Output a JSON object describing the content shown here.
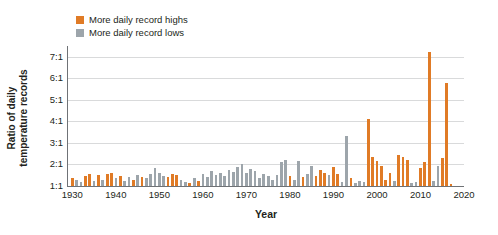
{
  "chart_data": {
    "type": "bar",
    "title": "",
    "subtitle": "",
    "xlabel": "Year",
    "ylabel": "Ratio of daily temperature records",
    "xlim": [
      1929,
      2020
    ],
    "ylim": [
      1,
      7.5
    ],
    "grid": true,
    "legend_position": "top-left",
    "ytick_labels": [
      "1:1",
      "2:1",
      "3:1",
      "4:1",
      "5:1",
      "6:1",
      "7:1"
    ],
    "ytick_values": [
      1,
      2,
      3,
      4,
      5,
      6,
      7
    ],
    "xtick_labels": [
      "1930",
      "1940",
      "1950",
      "1960",
      "1970",
      "1980",
      "1990",
      "2000",
      "2010",
      "2020"
    ],
    "xtick_values": [
      1930,
      1940,
      1950,
      1960,
      1970,
      1980,
      1990,
      2000,
      2010,
      2020
    ],
    "colors": {
      "highs": "#E07B26",
      "lows": "#9DA5AB",
      "gridline": "#D9DADB",
      "axis": "#6F7276",
      "text": "#231F20",
      "background": "#FFFFFF"
    },
    "series": [
      {
        "name": "More daily record highs",
        "color": "#E07B26"
      },
      {
        "name": "More daily record lows",
        "color": "#9DA5AB"
      }
    ],
    "bars": [
      {
        "year": 1930,
        "value": 1.35,
        "series": "highs"
      },
      {
        "year": 1931,
        "value": 1.3,
        "series": "lows"
      },
      {
        "year": 1932,
        "value": 1.2,
        "series": "lows"
      },
      {
        "year": 1933,
        "value": 1.45,
        "series": "highs"
      },
      {
        "year": 1934,
        "value": 1.55,
        "series": "highs"
      },
      {
        "year": 1935,
        "value": 1.25,
        "series": "lows"
      },
      {
        "year": 1936,
        "value": 1.5,
        "series": "highs"
      },
      {
        "year": 1937,
        "value": 1.3,
        "series": "lows"
      },
      {
        "year": 1938,
        "value": 1.55,
        "series": "highs"
      },
      {
        "year": 1939,
        "value": 1.6,
        "series": "highs"
      },
      {
        "year": 1940,
        "value": 1.35,
        "series": "lows"
      },
      {
        "year": 1941,
        "value": 1.45,
        "series": "highs"
      },
      {
        "year": 1942,
        "value": 1.25,
        "series": "lows"
      },
      {
        "year": 1943,
        "value": 1.4,
        "series": "lows"
      },
      {
        "year": 1944,
        "value": 1.3,
        "series": "highs"
      },
      {
        "year": 1945,
        "value": 1.5,
        "series": "lows"
      },
      {
        "year": 1946,
        "value": 1.4,
        "series": "highs"
      },
      {
        "year": 1947,
        "value": 1.35,
        "series": "lows"
      },
      {
        "year": 1948,
        "value": 1.55,
        "series": "lows"
      },
      {
        "year": 1949,
        "value": 1.85,
        "series": "lows"
      },
      {
        "year": 1950,
        "value": 1.6,
        "series": "lows"
      },
      {
        "year": 1951,
        "value": 1.45,
        "series": "lows"
      },
      {
        "year": 1952,
        "value": 1.4,
        "series": "highs"
      },
      {
        "year": 1953,
        "value": 1.55,
        "series": "highs"
      },
      {
        "year": 1954,
        "value": 1.5,
        "series": "highs"
      },
      {
        "year": 1955,
        "value": 1.3,
        "series": "lows"
      },
      {
        "year": 1956,
        "value": 1.2,
        "series": "lows"
      },
      {
        "year": 1957,
        "value": 1.15,
        "series": "highs"
      },
      {
        "year": 1958,
        "value": 1.35,
        "series": "lows"
      },
      {
        "year": 1959,
        "value": 1.25,
        "series": "highs"
      },
      {
        "year": 1960,
        "value": 1.55,
        "series": "lows"
      },
      {
        "year": 1961,
        "value": 1.4,
        "series": "lows"
      },
      {
        "year": 1962,
        "value": 1.7,
        "series": "lows"
      },
      {
        "year": 1963,
        "value": 1.5,
        "series": "lows"
      },
      {
        "year": 1964,
        "value": 1.6,
        "series": "lows"
      },
      {
        "year": 1965,
        "value": 1.45,
        "series": "lows"
      },
      {
        "year": 1966,
        "value": 1.75,
        "series": "lows"
      },
      {
        "year": 1967,
        "value": 1.65,
        "series": "lows"
      },
      {
        "year": 1968,
        "value": 1.9,
        "series": "lows"
      },
      {
        "year": 1969,
        "value": 2.0,
        "series": "lows"
      },
      {
        "year": 1970,
        "value": 1.6,
        "series": "lows"
      },
      {
        "year": 1971,
        "value": 1.8,
        "series": "lows"
      },
      {
        "year": 1972,
        "value": 1.7,
        "series": "lows"
      },
      {
        "year": 1973,
        "value": 1.35,
        "series": "lows"
      },
      {
        "year": 1974,
        "value": 1.55,
        "series": "lows"
      },
      {
        "year": 1975,
        "value": 1.45,
        "series": "lows"
      },
      {
        "year": 1976,
        "value": 1.3,
        "series": "lows"
      },
      {
        "year": 1977,
        "value": 1.5,
        "series": "lows"
      },
      {
        "year": 1978,
        "value": 2.1,
        "series": "lows"
      },
      {
        "year": 1979,
        "value": 2.2,
        "series": "lows"
      },
      {
        "year": 1980,
        "value": 1.45,
        "series": "highs"
      },
      {
        "year": 1981,
        "value": 1.3,
        "series": "lows"
      },
      {
        "year": 1982,
        "value": 2.15,
        "series": "lows"
      },
      {
        "year": 1983,
        "value": 1.4,
        "series": "highs"
      },
      {
        "year": 1984,
        "value": 1.55,
        "series": "lows"
      },
      {
        "year": 1985,
        "value": 1.95,
        "series": "lows"
      },
      {
        "year": 1986,
        "value": 1.45,
        "series": "highs"
      },
      {
        "year": 1987,
        "value": 1.75,
        "series": "highs"
      },
      {
        "year": 1988,
        "value": 1.6,
        "series": "highs"
      },
      {
        "year": 1989,
        "value": 1.5,
        "series": "lows"
      },
      {
        "year": 1990,
        "value": 1.9,
        "series": "highs"
      },
      {
        "year": 1991,
        "value": 1.55,
        "series": "highs"
      },
      {
        "year": 1992,
        "value": 1.2,
        "series": "lows"
      },
      {
        "year": 1993,
        "value": 3.3,
        "series": "lows"
      },
      {
        "year": 1994,
        "value": 1.35,
        "series": "highs"
      },
      {
        "year": 1995,
        "value": 1.15,
        "series": "lows"
      },
      {
        "year": 1996,
        "value": 1.25,
        "series": "lows"
      },
      {
        "year": 1997,
        "value": 1.2,
        "series": "lows"
      },
      {
        "year": 1998,
        "value": 4.1,
        "series": "highs"
      },
      {
        "year": 1999,
        "value": 2.35,
        "series": "highs"
      },
      {
        "year": 2000,
        "value": 2.15,
        "series": "highs"
      },
      {
        "year": 2001,
        "value": 1.95,
        "series": "highs"
      },
      {
        "year": 2002,
        "value": 1.3,
        "series": "highs"
      },
      {
        "year": 2003,
        "value": 1.6,
        "series": "highs"
      },
      {
        "year": 2004,
        "value": 1.25,
        "series": "lows"
      },
      {
        "year": 2005,
        "value": 2.45,
        "series": "highs"
      },
      {
        "year": 2006,
        "value": 2.35,
        "series": "highs"
      },
      {
        "year": 2007,
        "value": 2.2,
        "series": "highs"
      },
      {
        "year": 2008,
        "value": 1.15,
        "series": "lows"
      },
      {
        "year": 2009,
        "value": 1.2,
        "series": "lows"
      },
      {
        "year": 2010,
        "value": 1.85,
        "series": "highs"
      },
      {
        "year": 2011,
        "value": 2.1,
        "series": "highs"
      },
      {
        "year": 2012,
        "value": 7.2,
        "series": "highs"
      },
      {
        "year": 2013,
        "value": 1.25,
        "series": "lows"
      },
      {
        "year": 2014,
        "value": 1.95,
        "series": "lows"
      },
      {
        "year": 2015,
        "value": 2.3,
        "series": "highs"
      },
      {
        "year": 2016,
        "value": 5.8,
        "series": "highs"
      },
      {
        "year": 2017,
        "value": 1.1,
        "series": "highs"
      }
    ]
  },
  "legend": {
    "items": [
      {
        "label": "More daily record highs",
        "color": "#E07B26"
      },
      {
        "label": "More daily record lows",
        "color": "#9DA5AB"
      }
    ]
  },
  "axes": {
    "y_title": "Ratio of daily\ntemperature records",
    "x_title": "Year"
  }
}
